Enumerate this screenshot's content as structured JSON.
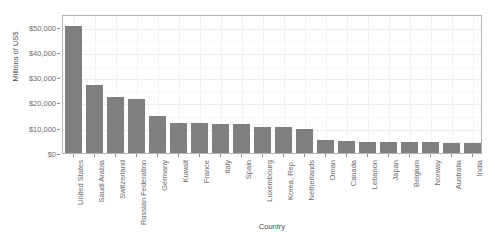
{
  "chart_data": {
    "type": "bar",
    "title": "",
    "title_clipped": "",
    "xlabel": "Country",
    "ylabel": "Millions of US$",
    "categories": [
      "United States",
      "Saudi Arabia",
      "Switzerland",
      "Russian Federation",
      "Germany",
      "Kuwait",
      "France",
      "Italy",
      "Spain",
      "Luxembourg",
      "Korea, Rep.",
      "Netherlands",
      "Oman",
      "Canada",
      "Lebanon",
      "Japan",
      "Belgium",
      "Norway",
      "Australia",
      "India"
    ],
    "values": [
      50200,
      27000,
      22000,
      21200,
      14500,
      11900,
      11700,
      11600,
      11500,
      10400,
      10200,
      9500,
      5200,
      4800,
      4300,
      4300,
      4200,
      4200,
      4000,
      3800
    ],
    "ylim": [
      0,
      55000
    ],
    "ytick_values": [
      0,
      10000,
      20000,
      30000,
      40000,
      50000
    ],
    "ytick_labels": [
      "$0",
      "$10,000",
      "$20,000",
      "$30,000",
      "$40,000",
      "$50,000"
    ],
    "grid": true,
    "legend": "none",
    "bar_color": "#7f7f7f",
    "panel_border_color": "#b4b4b4",
    "gridline_color": "#ededed",
    "axis_text_color": "#6b6b6b"
  }
}
